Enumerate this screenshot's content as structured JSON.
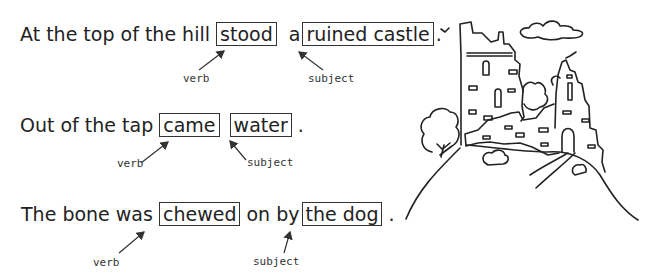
{
  "sentences": [
    {
      "before": "At the top of the hill",
      "box1": "stood",
      "middle": "a",
      "box2": "ruined castle",
      "end": ".",
      "verb_label": "verb",
      "subject_label": "subject"
    },
    {
      "before": "Out of the tap",
      "box1": "came",
      "middle": "",
      "box2": "water",
      "end": ".",
      "verb_label": "verb",
      "subject_label": "subject"
    },
    {
      "before": "The bone was",
      "box1": "chewed",
      "middle": "on by",
      "box2": "the dog",
      "end": ".",
      "verb_label": "verb",
      "subject_label": "subject"
    }
  ],
  "illustration": {
    "subject": "ruined castle on a hill",
    "line_color": "#222222"
  }
}
